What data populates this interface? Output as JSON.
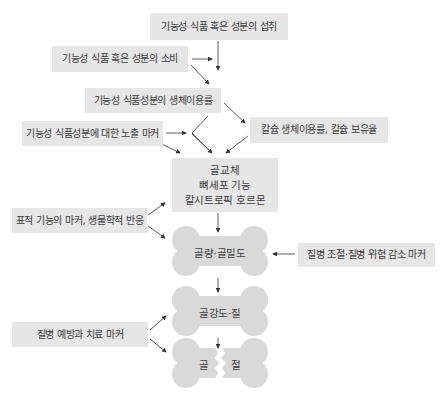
{
  "diagram": {
    "nodes": {
      "intake": "기능성 식품 혹은 성분의 섭취",
      "consumption": "기능성 식품 혹은 성분의 소비",
      "bioavailability": "기능성 식품성분의 생체이용률",
      "exposure_marker": "기능성 식품성분에 대한 노출 마커",
      "calcium": "칼슘 생체이용률, 칼슘 보유율",
      "center": {
        "line1": "골교체",
        "line2": "뼈세포 기능",
        "line3": "칼시트로픽 호르몬"
      },
      "target_marker": "표적 기능의 마커, 생물학적 반응",
      "bone_mass": "골량·골밀도",
      "disease_control_marker": "질병 조절·질병 위험 감소 마커",
      "bone_strength": "골강도·질",
      "prevention_marker": "질병 예방과 치료 마커",
      "fracture_left": "골",
      "fracture_right": "절"
    },
    "colors": {
      "box_fill": "#e6e6e6",
      "bone_fill": "#d9d9d9",
      "arrow": "#333333"
    }
  }
}
